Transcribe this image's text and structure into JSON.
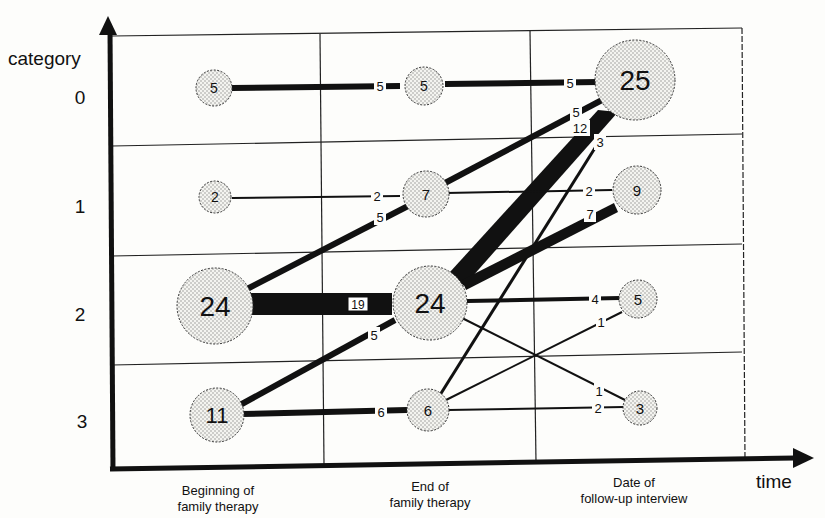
{
  "axis": {
    "y_label": "category",
    "x_label": "time",
    "categories": [
      "0",
      "1",
      "2",
      "3"
    ],
    "time_points": [
      [
        "Beginning of",
        "family therapy"
      ],
      [
        "End of",
        "family therapy"
      ],
      [
        "Date of",
        "follow-up interview"
      ]
    ]
  },
  "nodes": [
    {
      "id": "b0",
      "time": 0,
      "cat": 0,
      "value": "5"
    },
    {
      "id": "b1",
      "time": 0,
      "cat": 1,
      "value": "2"
    },
    {
      "id": "b2",
      "time": 0,
      "cat": 2,
      "value": "24"
    },
    {
      "id": "b3",
      "time": 0,
      "cat": 3,
      "value": "11"
    },
    {
      "id": "e0",
      "time": 1,
      "cat": 0,
      "value": "5"
    },
    {
      "id": "e1",
      "time": 1,
      "cat": 1,
      "value": "7"
    },
    {
      "id": "e2",
      "time": 1,
      "cat": 2,
      "value": "24"
    },
    {
      "id": "e3",
      "time": 1,
      "cat": 3,
      "value": "6"
    },
    {
      "id": "f0",
      "time": 2,
      "cat": 0,
      "value": "25"
    },
    {
      "id": "f1",
      "time": 2,
      "cat": 1,
      "value": "9"
    },
    {
      "id": "f2",
      "time": 2,
      "cat": 2,
      "value": "5"
    },
    {
      "id": "f3",
      "time": 2,
      "cat": 3,
      "value": "3"
    }
  ],
  "edges": [
    {
      "from": "b0",
      "to": "e0",
      "value": "5"
    },
    {
      "from": "b1",
      "to": "e1",
      "value": "2"
    },
    {
      "from": "b2",
      "to": "e1",
      "value": "5"
    },
    {
      "from": "b2",
      "to": "e2",
      "value": "19"
    },
    {
      "from": "b3",
      "to": "e2",
      "value": "5"
    },
    {
      "from": "b3",
      "to": "e3",
      "value": "6"
    },
    {
      "from": "e0",
      "to": "f0",
      "value": "5"
    },
    {
      "from": "e1",
      "to": "f0",
      "value": "5"
    },
    {
      "from": "e2",
      "to": "f0",
      "value": "12"
    },
    {
      "from": "e3",
      "to": "f0",
      "value": "3"
    },
    {
      "from": "e1",
      "to": "f1",
      "value": "2"
    },
    {
      "from": "e2",
      "to": "f1",
      "value": "7"
    },
    {
      "from": "e2",
      "to": "f2",
      "value": "4"
    },
    {
      "from": "e3",
      "to": "f2",
      "value": "1"
    },
    {
      "from": "e2",
      "to": "f3",
      "value": "1"
    },
    {
      "from": "e3",
      "to": "f3",
      "value": "2"
    }
  ]
}
